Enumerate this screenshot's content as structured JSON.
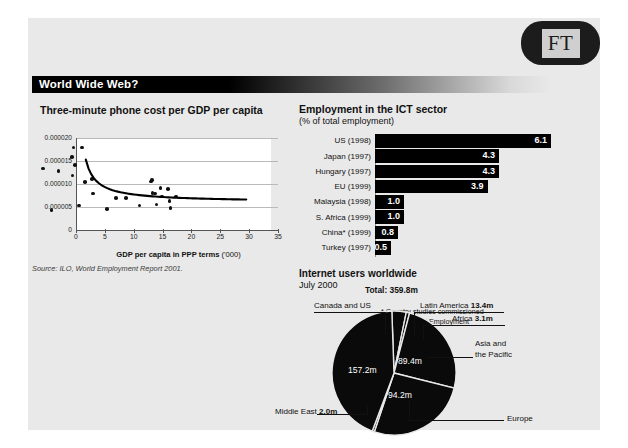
{
  "brand": {
    "logo_text": "FT",
    "logo_name": "ft-logo"
  },
  "headline": {
    "text": "World Wide Web?"
  },
  "source_note": "Source: ILO, World Employment Report 2001.",
  "scatter": {
    "title": "Three-minute phone cost per GDP per capita",
    "xlabel_main": "GDP per capita in PPP terms",
    "xlabel_unit": "('000)",
    "yticks": [
      "0.000020",
      "0.000015",
      "0.000010",
      "0.000005",
      "0"
    ],
    "xticks": [
      "0",
      "5",
      "10",
      "15",
      "20",
      "25",
      "30",
      "35"
    ]
  },
  "bar": {
    "title": "Employment in the ICT sector",
    "subtitle": "(% of total employment)",
    "note_marker": "*",
    "note": "Country studies commissioned for the World Employment Report 2001",
    "note_line1": "* Country studies commissioned",
    "note_line2": "for the World Employment",
    "note_line3": "Report 2001",
    "rows": [
      {
        "label": "US (1998)",
        "value": "6.1"
      },
      {
        "label": "Japan (1997)",
        "value": "4.3"
      },
      {
        "label": "Hungary (1997)",
        "value": "4.3"
      },
      {
        "label": "EU (1999)",
        "value": "3.9"
      },
      {
        "label": "Malaysia (1998)",
        "value": "1.0"
      },
      {
        "label": "S. Africa (1999)",
        "value": "1.0"
      },
      {
        "label": "China* (1999)",
        "value": "0.8"
      },
      {
        "label": "Turkey (1997)",
        "value": "0.5"
      }
    ]
  },
  "pie": {
    "title": "Internet users worldwide",
    "date": "July 2000",
    "total_label": "Total: 359.8m",
    "labels": {
      "canada_us": "Canada and US",
      "latin_america_name": "Latin America",
      "latin_america_value": "13.4m",
      "africa_name": "Africa",
      "africa_value": "3.1m",
      "asia_line1": "Asia and",
      "asia_line2": "the Pacific",
      "europe": "Europe",
      "middle_east_name": "Middle East",
      "middle_east_value": "2.0m"
    },
    "slice_values": {
      "canada_us": "157.2m",
      "asia": "89.4m",
      "europe": "94.2m"
    }
  },
  "chart_data": [
    {
      "type": "scatter",
      "title": "Three-minute phone cost per GDP per capita",
      "xlabel": "GDP per capita in PPP terms ('000)",
      "ylabel": "",
      "xlim": [
        0,
        35
      ],
      "ylim": [
        0,
        2e-05
      ],
      "grid": true,
      "xticks": [
        0,
        5,
        10,
        15,
        20,
        25,
        30,
        35
      ],
      "yticks": [
        0,
        5e-06,
        1e-05,
        1.5e-05,
        2e-05
      ],
      "points": [
        [
          1.9,
          1.21e-05
        ],
        [
          3.4,
          3e-06
        ],
        [
          4.6,
          1.15e-05
        ],
        [
          6.9,
          1.46e-05
        ],
        [
          7.0,
          1.05e-05
        ],
        [
          7.2,
          1.66e-05
        ],
        [
          7.4,
          1.28e-05
        ],
        [
          8.1,
          4e-06
        ],
        [
          8.7,
          1.66e-05
        ],
        [
          9.2,
          9.1e-06
        ],
        [
          10.4,
          9.8e-06
        ],
        [
          10.6,
          6.6e-06
        ],
        [
          13.0,
          3.2e-06
        ],
        [
          14.6,
          5.7e-06
        ],
        [
          16.3,
          5.6e-06
        ],
        [
          18.6,
          4e-06
        ],
        [
          20.6,
          9.2e-06
        ],
        [
          20.8,
          9.6e-06
        ],
        [
          20.9,
          6.8e-06
        ],
        [
          21.3,
          6.6e-06
        ],
        [
          21.6,
          4.2e-06
        ],
        [
          22.3,
          7.8e-06
        ],
        [
          22.5,
          6e-06
        ],
        [
          23.6,
          7.6e-06
        ],
        [
          23.8,
          5e-06
        ],
        [
          24.0,
          3.5e-06
        ],
        [
          25.0,
          6e-06
        ]
      ],
      "trend": {
        "type": "power-fit",
        "note": "decaying curve from ~0.0000129 at x=1.7 to ~0.0000060 at x=29.5"
      }
    },
    {
      "type": "bar",
      "orientation": "horizontal",
      "title": "Employment in the ICT sector",
      "subtitle": "(% of total employment)",
      "ylabel": "",
      "xlabel": "% of total employment",
      "categories": [
        "US (1998)",
        "Japan (1997)",
        "Hungary (1997)",
        "EU (1999)",
        "Malaysia (1998)",
        "S. Africa (1999)",
        "China* (1999)",
        "Turkey (1997)"
      ],
      "values": [
        6.1,
        4.3,
        4.3,
        3.9,
        1.0,
        1.0,
        0.8,
        0.5
      ],
      "xlim": [
        0,
        6.1
      ]
    },
    {
      "type": "pie",
      "title": "Internet users worldwide",
      "subtitle": "July 2000",
      "total": 359.8,
      "unit": "m",
      "categories": [
        "Canada and US",
        "Europe",
        "Asia and the Pacific",
        "Latin America",
        "Africa",
        "Middle East"
      ],
      "values": [
        157.2,
        94.2,
        89.4,
        13.4,
        3.1,
        2.0
      ]
    }
  ]
}
